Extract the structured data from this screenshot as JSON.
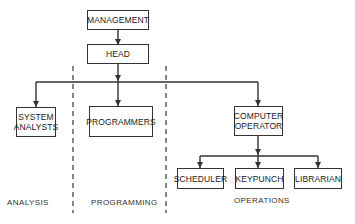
{
  "diagram": {
    "type": "org-chart",
    "nodes": {
      "management": "MANAGEMENT",
      "head": "HEAD",
      "system_analysts": "SYSTEM\nANALYSTS",
      "programmers": "PROGRAMMERS",
      "computer_operator": "COMPUTER\nOPERATOR",
      "scheduler": "SCHEDULER",
      "keypunch": "KEYPUNCH",
      "librarian": "LIBRARIAN"
    },
    "sections": {
      "analysis": "ANALYSIS",
      "programming": "PROGRAMMING",
      "operations": "OPERATIONS"
    },
    "edges": [
      [
        "MANAGEMENT",
        "HEAD"
      ],
      [
        "HEAD",
        "SYSTEM ANALYSTS"
      ],
      [
        "HEAD",
        "PROGRAMMERS"
      ],
      [
        "HEAD",
        "COMPUTER OPERATOR"
      ],
      [
        "COMPUTER OPERATOR",
        "SCHEDULER"
      ],
      [
        "COMPUTER OPERATOR",
        "KEYPUNCH"
      ],
      [
        "COMPUTER OPERATOR",
        "LIBRARIAN"
      ]
    ],
    "colors": {
      "line": "#333333",
      "background": "#ffffff"
    }
  }
}
